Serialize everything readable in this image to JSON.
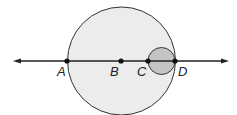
{
  "diagram": {
    "big_circle": {
      "cx": 121.5,
      "cy": 61,
      "r": 54,
      "fill": "#ececec",
      "stroke": "#333333"
    },
    "small_circle": {
      "cx": 161.5,
      "cy": 61,
      "r": 13.5,
      "fill": "#c4c4c4",
      "stroke": "#333333"
    },
    "line": {
      "x1": 13,
      "x2": 229,
      "y": 61,
      "color": "#222222"
    },
    "points": [
      {
        "label": "A",
        "x": 67,
        "y": 61,
        "lx": 58,
        "ly": 79
      },
      {
        "label": "B",
        "x": 121,
        "y": 61,
        "lx": 111,
        "ly": 79
      },
      {
        "label": "C",
        "x": 148,
        "y": 61,
        "lx": 137,
        "ly": 79
      },
      {
        "label": "D",
        "x": 175,
        "y": 61,
        "lx": 178,
        "ly": 79
      }
    ]
  }
}
